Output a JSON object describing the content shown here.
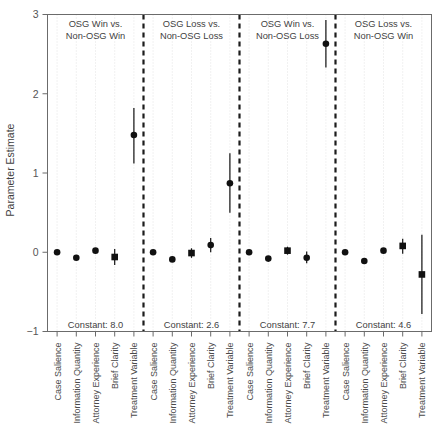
{
  "figure": {
    "ylabel": "Parameter Estimate",
    "y_ticks": [
      "3",
      "2",
      "1",
      "0",
      "-1"
    ],
    "ylim": [
      -1,
      3
    ]
  },
  "chart_data": {
    "type": "scatter",
    "title": "",
    "xlabel": "",
    "ylabel": "Parameter Estimate",
    "ylim": [
      -1,
      3
    ],
    "yticks": [
      -1,
      0,
      1,
      2,
      3
    ],
    "grid": "vertical dotted gridlines at each category",
    "legend": "none",
    "orientation": "coefficient plot with 95% confidence intervals, four panels separated by vertical dashed lines",
    "categories": [
      "Case Salience",
      "Information Quantity",
      "Attorney Experience",
      "Brief Clarity",
      "Treatment Variable"
    ],
    "panels": [
      {
        "name": "OSG Win vs. Non-OSG Win",
        "title_line1": "OSG Win vs.",
        "title_line2": "Non-OSG Win",
        "constant_label": "Constant: 8.0",
        "constant": 8.0,
        "points": [
          {
            "category": "Case Salience",
            "estimate": 0.0,
            "low": -0.02,
            "high": 0.02,
            "marker": "circle"
          },
          {
            "category": "Information Quantity",
            "estimate": -0.07,
            "low": -0.09,
            "high": -0.05,
            "marker": "circle"
          },
          {
            "category": "Attorney Experience",
            "estimate": 0.02,
            "low": 0.0,
            "high": 0.04,
            "marker": "circle"
          },
          {
            "category": "Brief Clarity",
            "estimate": -0.06,
            "low": -0.16,
            "high": 0.04,
            "marker": "square"
          },
          {
            "category": "Treatment Variable",
            "estimate": 1.48,
            "low": 1.12,
            "high": 1.82,
            "marker": "circle"
          }
        ]
      },
      {
        "name": "OSG Loss vs. Non-OSG Loss",
        "title_line1": "OSG Loss vs.",
        "title_line2": "Non-OSG Loss",
        "constant_label": "Constant: 2.6",
        "constant": 2.6,
        "points": [
          {
            "category": "Case Salience",
            "estimate": 0.0,
            "low": -0.02,
            "high": 0.02,
            "marker": "circle"
          },
          {
            "category": "Information Quantity",
            "estimate": -0.09,
            "low": -0.11,
            "high": -0.07,
            "marker": "circle"
          },
          {
            "category": "Attorney Experience",
            "estimate": -0.01,
            "low": -0.07,
            "high": 0.05,
            "marker": "square"
          },
          {
            "category": "Brief Clarity",
            "estimate": 0.09,
            "low": 0.0,
            "high": 0.18,
            "marker": "circle"
          },
          {
            "category": "Treatment Variable",
            "estimate": 0.87,
            "low": 0.5,
            "high": 1.25,
            "marker": "circle"
          }
        ]
      },
      {
        "name": "OSG Win vs. Non-OSG Loss",
        "title_line1": "OSG Win vs.",
        "title_line2": "Non-OSG Loss",
        "constant_label": "Constant: 7.7",
        "constant": 7.7,
        "points": [
          {
            "category": "Case Salience",
            "estimate": 0.0,
            "low": -0.02,
            "high": 0.02,
            "marker": "circle"
          },
          {
            "category": "Information Quantity",
            "estimate": -0.08,
            "low": -0.1,
            "high": -0.06,
            "marker": "circle"
          },
          {
            "category": "Attorney Experience",
            "estimate": 0.02,
            "low": -0.03,
            "high": 0.07,
            "marker": "square"
          },
          {
            "category": "Brief Clarity",
            "estimate": -0.07,
            "low": -0.14,
            "high": 0.01,
            "marker": "circle"
          },
          {
            "category": "Treatment Variable",
            "estimate": 2.63,
            "low": 2.33,
            "high": 2.93,
            "marker": "circle"
          }
        ]
      },
      {
        "name": "OSG Loss vs. Non-OSG Win",
        "title_line1": "OSG Loss vs.",
        "title_line2": "Non-OSG Win",
        "constant_label": "Constant: 4.6",
        "constant": 4.6,
        "points": [
          {
            "category": "Case Salience",
            "estimate": 0.0,
            "low": -0.02,
            "high": 0.02,
            "marker": "circle"
          },
          {
            "category": "Information Quantity",
            "estimate": -0.11,
            "low": -0.13,
            "high": -0.09,
            "marker": "circle"
          },
          {
            "category": "Attorney Experience",
            "estimate": 0.02,
            "low": 0.0,
            "high": 0.04,
            "marker": "circle"
          },
          {
            "category": "Brief Clarity",
            "estimate": 0.08,
            "low": -0.02,
            "high": 0.17,
            "marker": "square"
          },
          {
            "category": "Treatment Variable",
            "estimate": -0.28,
            "low": -0.78,
            "high": 0.22,
            "marker": "square"
          }
        ]
      }
    ]
  }
}
